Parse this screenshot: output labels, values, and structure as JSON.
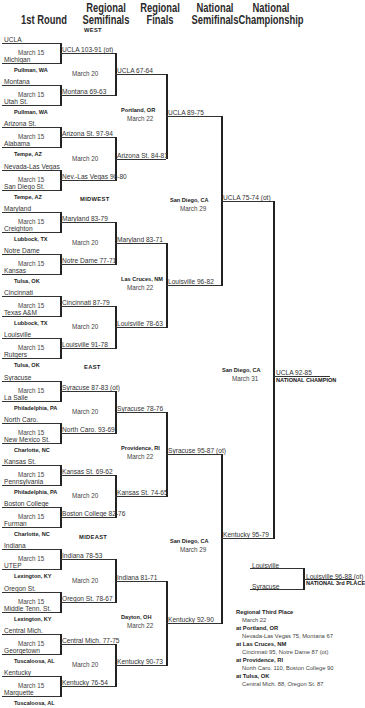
{
  "headers": {
    "round1": "1st Round",
    "regional_semis": [
      "Regional",
      "Semifinals"
    ],
    "regional_finals": [
      "Regional",
      "Finals"
    ],
    "national_semis": [
      "National",
      "Semifinals"
    ],
    "national_championship": [
      "National",
      "Championship"
    ]
  },
  "regions": {
    "west": "WEST",
    "midwest": "MIDWEST",
    "east": "EAST",
    "mideast": "MIDEAST"
  },
  "round1": [
    {
      "top": "UCLA",
      "bottom": "Michigan",
      "date": "March 15",
      "site_after": "Pullman, WA"
    },
    {
      "top": "Montana",
      "bottom": "Utah St.",
      "date": "March 15",
      "site_after": "Pullman, WA"
    },
    {
      "top": "Arizona St.",
      "bottom": "Alabama",
      "date": "March 15",
      "site_after": "Tempe, AZ"
    },
    {
      "top": "Nevada-Las Vegas",
      "bottom": "San Diego St.",
      "date": "March 15",
      "site_after": "Tempe, AZ"
    },
    {
      "top": "Maryland",
      "bottom": "Creighton",
      "date": "March 15",
      "site_after": "Lubbock, TX"
    },
    {
      "top": "Notre Dame",
      "bottom": "Kansas",
      "date": "March 15",
      "site_after": "Tulsa, OK"
    },
    {
      "top": "Cincinnati",
      "bottom": "Texas A&M",
      "date": "March 15",
      "site_after": "Lubbock, TX"
    },
    {
      "top": "Louisville",
      "bottom": "Rutgers",
      "date": "March 15",
      "site_after": "Tulsa, OK"
    },
    {
      "top": "Syracuse",
      "bottom": "La Salle",
      "date": "March 15",
      "site_after": "Philadelphia, PA"
    },
    {
      "top": "North Caro.",
      "bottom": "New Mexico St.",
      "date": "March 15",
      "site_after": "Charlotte, NC"
    },
    {
      "top": "Kansas St.",
      "bottom": "Pennsylvania",
      "date": "March 15",
      "site_after": "Philadelphia, PA"
    },
    {
      "top": "Boston College",
      "bottom": "Furman",
      "date": "March 15",
      "site_after": "Charlotte, NC"
    },
    {
      "top": "Indiana",
      "bottom": "UTEP",
      "date": "March 15",
      "site_after": "Lexington, KY"
    },
    {
      "top": "Oregon St.",
      "bottom": "Middle Tenn. St.",
      "date": "March 15",
      "site_after": "Lexington, KY"
    },
    {
      "top": "Central Mich.",
      "bottom": "Georgetown",
      "date": "March 15",
      "site_after": "Tuscaloosa, AL"
    },
    {
      "top": "Kentucky",
      "bottom": "Marquette",
      "date": "March 15",
      "site_after": "Tuscaloosa, AL"
    }
  ],
  "round2": [
    "UCLA 103-91 (ot)",
    "Montana 69-63",
    "Arizona St. 97-94",
    "Nev.-Las Vegas 90-80",
    "Maryland 83-79",
    "Notre Dame 77-71",
    "Cincinnati 87-79",
    "Louisville 91-78",
    "Syracuse 87-83 (ot)",
    "North Caro. 93-69",
    "Kansas St. 69-62",
    "Boston College 82-76",
    "Indiana 78-53",
    "Oregon St. 78-67",
    "Central Mich. 77-75",
    "Kentucky 76-54"
  ],
  "round2_date": "March 20",
  "round3": [
    "UCLA 67-64",
    "Arizona St. 84-81",
    "Maryland 83-71",
    "Louisville 78-63",
    "Syracuse 78-76",
    "Kansas St. 74-65",
    "Indiana 81-71",
    "Kentucky 90-73"
  ],
  "regional_final_sites": [
    {
      "site": "Portland, OR",
      "date": "March 22"
    },
    {
      "site": "Las Cruces, NM",
      "date": "March 22"
    },
    {
      "site": "Providence, RI",
      "date": "March 22"
    },
    {
      "site": "Dayton, OH",
      "date": "March 22"
    }
  ],
  "round4": [
    "UCLA 89-75",
    "Louisville 96-82",
    "Syracuse 95-87 (ot)",
    "Kentucky 92-90"
  ],
  "national_semi_sites": [
    {
      "site": "San Diego, CA",
      "date": "March 29"
    },
    {
      "site": "San Diego, CA",
      "date": "March 29"
    }
  ],
  "round5": [
    "UCLA 75-74 (ot)",
    "Kentucky 95-79"
  ],
  "final_site": {
    "site": "San Diego, CA",
    "date": "March 31"
  },
  "champion": {
    "result": "UCLA 92-85",
    "label": "NATIONAL CHAMPION"
  },
  "third_place": {
    "team1": "Louisville",
    "team2": "Syracuse",
    "result": "Louisville 96-88 (ot)",
    "label": "NATIONAL 3rd PLACE"
  },
  "regional_third": {
    "title": "Regional Third Place",
    "date": "March 22",
    "games": [
      {
        "site": "at Portland, OR",
        "result": "Nevada-Las Vegas 75, Montana 67"
      },
      {
        "site": "at Las Cruces, NM",
        "result": "Cincinnati 95, Notre Dame 87 (ot)"
      },
      {
        "site": "at Providence, RI",
        "result": "North Caro. 110, Boston College 90"
      },
      {
        "site": "at Tulsa, OK",
        "result": "Central Mich. 88, Oregon St. 87"
      }
    ]
  }
}
